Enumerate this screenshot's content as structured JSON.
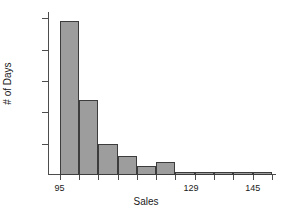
{
  "chart_data": {
    "type": "bar",
    "title": "",
    "xlabel": "Sales",
    "ylabel": "# of Days",
    "grid": false,
    "legend": null,
    "bin_width": 5,
    "bin_starts": [
      95,
      100,
      105,
      110,
      115,
      120,
      125,
      130,
      135,
      140,
      145
    ],
    "categories": [
      "95",
      "100",
      "105",
      "110",
      "115",
      "120",
      "125",
      "130",
      "135",
      "140",
      "145"
    ],
    "values": [
      49,
      24,
      10,
      6,
      3,
      4,
      1,
      1,
      1,
      1,
      1
    ],
    "xlim": [
      92,
      150
    ],
    "ylim": [
      0,
      52
    ],
    "xticks": [
      95,
      129,
      145
    ],
    "xtick_labels": [
      "95",
      "129",
      "145"
    ],
    "yticks": [
      10,
      20,
      30,
      40,
      50
    ],
    "ytick_labels": [
      "10",
      "20",
      "30",
      "40",
      "50"
    ],
    "bar_color": "#9d9d9d",
    "bar_edge_color": "#3c3c3c",
    "axis_color": "#4d4d4d",
    "background": "#ffffff"
  }
}
